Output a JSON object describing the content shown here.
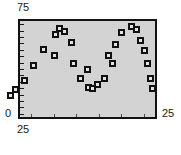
{
  "chart_data": {
    "type": "scatter",
    "title": "",
    "xlabel": "",
    "ylabel": "",
    "xlim": [
      25,
      25
    ],
    "ylim": [
      0,
      75
    ],
    "grid": false,
    "legend": null,
    "axis_labels": {
      "y_max": "75",
      "y_min": "0",
      "x_min": "25",
      "x_max": "25"
    },
    "y_tick_count": 15,
    "x_tick_count": 6,
    "marker": "black-square-with-light-center",
    "points": [
      {
        "px": 43.5,
        "py": 49.5
      },
      {
        "px": 33.0,
        "py": 65.0
      },
      {
        "px": 24.5,
        "py": 80.5
      },
      {
        "px": 15.5,
        "py": 89.5
      },
      {
        "px": 10.0,
        "py": 95.5
      },
      {
        "px": 55.5,
        "py": 34.0
      },
      {
        "px": 59.5,
        "py": 28.5
      },
      {
        "px": 64.5,
        "py": 31.0
      },
      {
        "px": 71.5,
        "py": 42.0
      },
      {
        "px": 54.0,
        "py": 55.0
      },
      {
        "px": 73.5,
        "py": 63.0
      },
      {
        "px": 80.5,
        "py": 78.0
      },
      {
        "px": 88.0,
        "py": 87.5
      },
      {
        "px": 92.0,
        "py": 88.5
      },
      {
        "px": 97.5,
        "py": 84.0
      },
      {
        "px": 104.5,
        "py": 78.5
      },
      {
        "px": 112.0,
        "py": 63.5
      },
      {
        "px": 108.5,
        "py": 55.0
      },
      {
        "px": 115.5,
        "py": 44.5
      },
      {
        "px": 121.5,
        "py": 32.5
      },
      {
        "px": 131.5,
        "py": 26.5
      },
      {
        "px": 136.0,
        "py": 29.0
      },
      {
        "px": 140.0,
        "py": 40.0
      },
      {
        "px": 144.5,
        "py": 50.5
      },
      {
        "px": 147.5,
        "py": 63.5
      },
      {
        "px": 150.0,
        "py": 78.0
      },
      {
        "px": 152.0,
        "py": 88.5
      },
      {
        "px": 87.0,
        "py": 69.0
      }
    ]
  }
}
